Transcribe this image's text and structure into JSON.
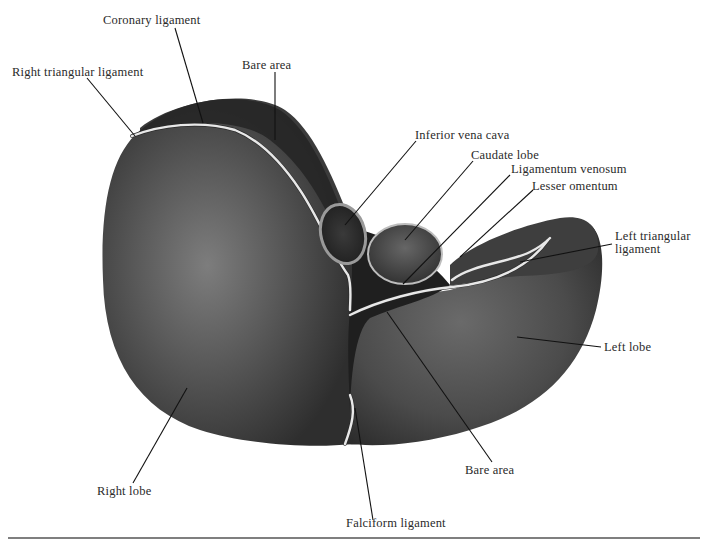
{
  "figure": {
    "labels": {
      "coronary_ligament": "Coronary ligament",
      "right_triangular_ligament": "Right triangular ligament",
      "bare_area_top": "Bare area",
      "inferior_vena_cava": "Inferior vena cava",
      "caudate_lobe": "Caudate lobe",
      "ligamentum_venosum": "Ligamentum venosum",
      "lesser_omentum": "Lesser omentum",
      "left_triangular_ligament_line1": "Left triangular",
      "left_triangular_ligament_line2": "ligament",
      "left_lobe": "Left lobe",
      "bare_area_bottom": "Bare area",
      "right_lobe": "Right lobe",
      "falciform_ligament": "Falciform ligament"
    },
    "colors": {
      "organ_dark": "#2b2b2b",
      "organ_mid": "#555555",
      "organ_light": "#8a8a8a",
      "ligament": "#e8e8e8",
      "bottom_rule": "#555555"
    }
  }
}
